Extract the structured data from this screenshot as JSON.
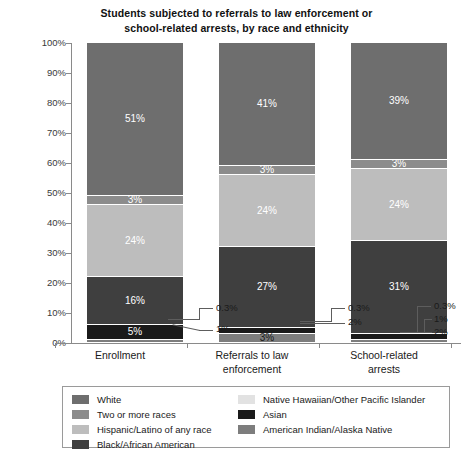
{
  "chart_data": {
    "type": "bar",
    "subtype": "100% stacked bar",
    "title": "Students subjected to referrals to law enforcement or school-related arrests, by race and ethnicity",
    "title_line1": "Students subjected to referrals to law enforcement or",
    "title_line2": "school-related arrests, by race and ethnicity",
    "xlabel": "",
    "ylabel": "",
    "ylim": [
      0,
      100
    ],
    "yticks": [
      "0%",
      "10%",
      "20%",
      "30%",
      "40%",
      "50%",
      "60%",
      "70%",
      "80%",
      "90%",
      "100%"
    ],
    "grid": false,
    "legend_position": "bottom",
    "categories": [
      "Enrollment",
      "Referrals to law enforcement",
      "School-related arrests"
    ],
    "category_lines": [
      [
        "Enrollment"
      ],
      [
        "Referrals to law",
        "enforcement"
      ],
      [
        "School-related",
        "arrests"
      ]
    ],
    "series": [
      {
        "name": "White",
        "color": "#6e6e6e",
        "texture": "solid",
        "values": [
          51,
          41,
          39
        ],
        "labels": [
          "51%",
          "41%",
          "39%"
        ]
      },
      {
        "name": "Two or more races",
        "color": "#8c8c8c",
        "texture": "solid",
        "values": [
          3,
          3,
          3
        ],
        "labels": [
          "3%",
          "3%",
          "3%"
        ]
      },
      {
        "name": "Hispanic/Latino of any race",
        "color": "#bdbdbd",
        "texture": "vstripe",
        "values": [
          24,
          24,
          24
        ],
        "labels": [
          "24%",
          "24%",
          "24%"
        ]
      },
      {
        "name": "Black/African American",
        "color": "#3f3f3f",
        "texture": "solid",
        "values": [
          16,
          27,
          31
        ],
        "labels": [
          "16%",
          "27%",
          "31%"
        ]
      },
      {
        "name": "Asian",
        "color": "#1a1a1a",
        "texture": "hstripe",
        "values": [
          5,
          2,
          2
        ],
        "labels": [
          "5%",
          "2%",
          "2%"
        ]
      },
      {
        "name": "American Indian/Alaska Native",
        "color": "#7d7d7d",
        "texture": "dots",
        "values": [
          1,
          3,
          1
        ],
        "labels": [
          "1%",
          "3%",
          "1%"
        ]
      },
      {
        "name": "Native Hawaiian/Other Pacific Islander",
        "color": "#e2e2e2",
        "texture": "solid",
        "values": [
          0.3,
          0.3,
          0.3
        ],
        "labels": [
          "0.3%",
          "0.3%",
          "0.3%"
        ]
      }
    ],
    "annotations": {
      "enrollment": [
        "0.3%",
        "1%"
      ],
      "referrals": [
        "0.3%",
        "2%"
      ],
      "arrests": [
        "0.3%",
        "1%",
        "2%"
      ]
    },
    "inbar_labels": {
      "enrollment": [
        "51%",
        "3%",
        "24%",
        "16%",
        "5%"
      ],
      "referrals": [
        "41%",
        "3%",
        "24%",
        "27%",
        "3%"
      ],
      "arrests": [
        "39%",
        "3%",
        "24%",
        "31%"
      ]
    }
  },
  "legend": {
    "column_left": [
      {
        "label": "White",
        "color": "#6e6e6e"
      },
      {
        "label": "Two or more races",
        "color": "#8c8c8c"
      },
      {
        "label": "Hispanic/Latino of any race",
        "color": "#bdbdbd"
      },
      {
        "label": "Black/African American",
        "color": "#3f3f3f"
      }
    ],
    "column_right": [
      {
        "label": "Native Hawaiian/Other Pacific Islander",
        "color": "#e2e2e2"
      },
      {
        "label": "Asian",
        "color": "#1a1a1a"
      },
      {
        "label": "American Indian/Alaska Native",
        "color": "#7d7d7d"
      }
    ]
  },
  "colors": {
    "axis": "#8a8a8a",
    "text": "#1a1a1a",
    "background": "#ffffff",
    "legend_border": "#9a9a9a"
  }
}
